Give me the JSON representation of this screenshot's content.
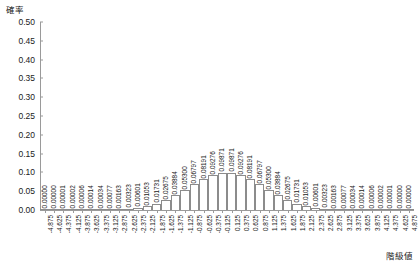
{
  "chart_data": {
    "type": "bar",
    "title": "",
    "subtitle": "",
    "xlabel": "階級値",
    "ylabel": "確率",
    "grid": false,
    "legend": null,
    "ylim": [
      0.0,
      0.5
    ],
    "ytick_labels": [
      "0.50",
      "0.45",
      "0.40",
      "0.35",
      "0.30",
      "0.25",
      "0.20",
      "0.15",
      "0.10",
      "0.05",
      "0.00"
    ],
    "ytick_values": [
      0.5,
      0.45,
      0.4,
      0.35,
      0.3,
      0.25,
      0.2,
      0.15,
      0.1,
      0.05,
      0.0
    ],
    "xlim": [
      -5.0,
      5.0
    ],
    "categories": [
      "-4.875",
      "-4.625",
      "-4.375",
      "-4.125",
      "-3.875",
      "-3.625",
      "-3.375",
      "-3.125",
      "-2.875",
      "-2.625",
      "-2.375",
      "-2.125",
      "-1.875",
      "-1.625",
      "-1.375",
      "-1.125",
      "-0.875",
      "-0.625",
      "-0.375",
      "-0.125",
      "0.125",
      "0.375",
      "0.625",
      "0.875",
      "1.125",
      "1.375",
      "1.625",
      "1.875",
      "2.125",
      "2.375",
      "2.625",
      "2.875",
      "3.125",
      "3.375",
      "3.625",
      "3.875",
      "4.125",
      "4.375",
      "4.625",
      "4.875"
    ],
    "values": [
      0.0,
      0.0,
      1e-05,
      2e-05,
      6e-05,
      0.00014,
      0.00034,
      0.00077,
      0.00163,
      0.00323,
      0.00601,
      0.01053,
      0.01731,
      0.02675,
      0.03884,
      0.053,
      0.06797,
      0.08191,
      0.09276,
      0.09871,
      0.09871,
      0.09276,
      0.08191,
      0.06797,
      0.053,
      0.03884,
      0.02675,
      0.01731,
      0.01053,
      0.00601,
      0.00323,
      0.00163,
      0.00077,
      0.00034,
      0.00014,
      6e-05,
      2e-05,
      1e-05,
      0.0,
      0.0
    ],
    "value_labels": [
      "0.00000",
      "0.00000",
      "0.00001",
      "0.00002",
      "0.00006",
      "0.00014",
      "0.00034",
      "0.00077",
      "0.00163",
      "0.00323",
      "0.00601",
      "0.01053",
      "0.01731",
      "0.02675",
      "0.03884",
      "0.05300",
      "0.06797",
      "0.08191",
      "0.09276",
      "0.09871",
      "0.09871",
      "0.09276",
      "0.08191",
      "0.06797",
      "0.05300",
      "0.03884",
      "0.02675",
      "0.01731",
      "0.01053",
      "0.00601",
      "0.00323",
      "0.00163",
      "0.00077",
      "0.00034",
      "0.00014",
      "0.00006",
      "0.00002",
      "0.00001",
      "0.00000",
      "0.00000"
    ],
    "bar_edge_color": "#8c8c8c",
    "bar_fill_color": "#ffffff",
    "axis_color": "#9a9a9a",
    "text_color": "#1a1a1a"
  }
}
